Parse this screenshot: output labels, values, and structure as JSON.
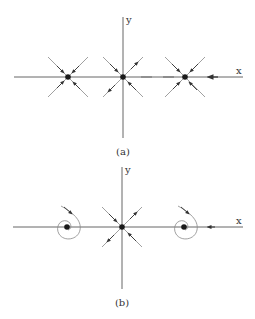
{
  "figure": {
    "panels": [
      {
        "caption": "(a)",
        "x_label": "x",
        "y_label": "y",
        "fixed_points": [
          {
            "position": "left",
            "type": "stable node"
          },
          {
            "position": "origin",
            "type": "saddle"
          },
          {
            "position": "right",
            "type": "stable node"
          }
        ]
      },
      {
        "caption": "(b)",
        "x_label": "x",
        "y_label": "y",
        "fixed_points": [
          {
            "position": "left",
            "type": "stable spiral"
          },
          {
            "position": "origin",
            "type": "saddle"
          },
          {
            "position": "right",
            "type": "stable spiral"
          }
        ]
      }
    ],
    "colors": {
      "axis": "#555555",
      "trajectory": "#888888",
      "fixed_point": "#1a1a1a"
    }
  }
}
